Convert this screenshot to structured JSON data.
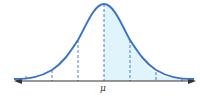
{
  "diagram": {
    "type": "normal-distribution-curve",
    "center_label": "μ",
    "shaded_region": "right half (x ≥ μ)",
    "dashed_lines_at_sigma": [
      -2,
      -1,
      0,
      1,
      2
    ],
    "colors": {
      "curve": "#3a73c8",
      "dashed": "#4a7fd0",
      "shade": "#e0f4fb",
      "axis": "#333333"
    }
  }
}
